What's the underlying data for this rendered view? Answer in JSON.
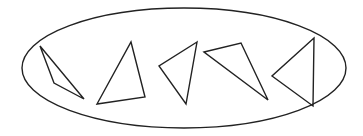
{
  "diagram": {
    "stroke_color": "#222222",
    "background": "#ffffff",
    "ellipse": {
      "cx": 184,
      "cy": 68,
      "rx": 162,
      "ry": 60
    },
    "triangles": [
      {
        "points": "40,46 54,83 84,99"
      },
      {
        "points": "131,42 145,97 97,104"
      },
      {
        "points": "197,42 159,66 186,104"
      },
      {
        "points": "204,52 241,43 268,100"
      },
      {
        "points": "314,38 272,76 313,106"
      }
    ]
  }
}
